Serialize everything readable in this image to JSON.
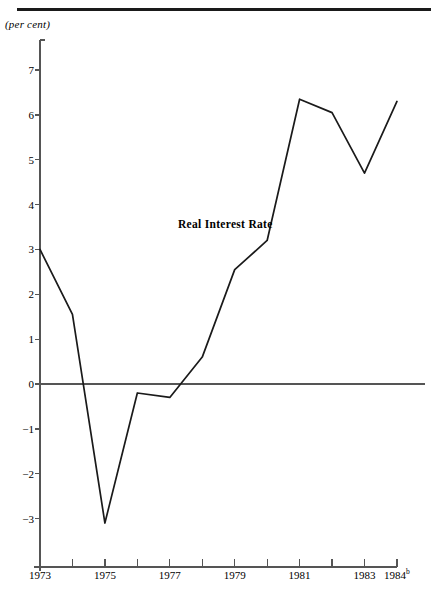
{
  "figure": {
    "unit_label": "(per cent)",
    "series_label": "Real Interest Rate"
  },
  "chart_data": {
    "type": "line",
    "title": "",
    "subtitle": "",
    "xlabel": "",
    "ylabel": "(per cent)",
    "grid": false,
    "legend": "inline-annotation",
    "annotations": [
      {
        "text": "Real Interest Rate",
        "x": 1978.2,
        "y": 3.05
      }
    ],
    "x": [
      1973,
      1974,
      1975,
      1976,
      1977,
      1978,
      1979,
      1980,
      1981,
      1982,
      1983,
      1984
    ],
    "series": [
      {
        "name": "Real Interest Rate",
        "values": [
          3.0,
          1.55,
          -3.1,
          -0.2,
          -0.3,
          0.6,
          2.55,
          3.2,
          6.35,
          6.05,
          4.7,
          6.3
        ]
      }
    ],
    "xlim": [
      1973,
      1984
    ],
    "ylim": [
      -3.6,
      7.6
    ],
    "xticks": [
      1973,
      1974,
      1975,
      1976,
      1977,
      1978,
      1979,
      1980,
      1981,
      1982,
      1983,
      1984
    ],
    "xtick_labels": [
      "1973",
      "",
      "1975",
      "",
      "1977",
      "",
      "1979",
      "",
      "1981",
      "",
      "1983",
      "1984"
    ],
    "xtick_superscripts": [
      "",
      "",
      "",
      "",
      "",
      "",
      "",
      "",
      "",
      "",
      "",
      "b"
    ],
    "yticks": [
      -3,
      -2,
      -1,
      0,
      1,
      2,
      3,
      4,
      5,
      6,
      7
    ],
    "ytick_labels": [
      "−3",
      "−2",
      "−1",
      "0",
      "1",
      "2",
      "3",
      "4",
      "5",
      "6",
      "7"
    ],
    "zero_line": 0,
    "colors": {
      "line": "#1a1a1a",
      "axis": "#555555",
      "rule": "#1a1a1a",
      "background": "#ffffff"
    }
  }
}
